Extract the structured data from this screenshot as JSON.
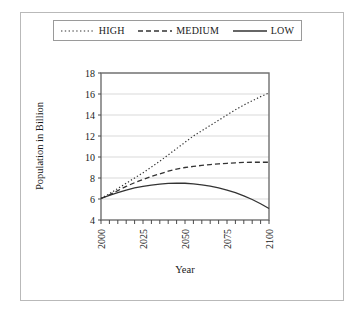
{
  "chart_data": {
    "type": "line",
    "title": "",
    "xlabel": "Year",
    "ylabel": "Population in Billion",
    "xlim": [
      2000,
      2100
    ],
    "ylim": [
      4,
      18
    ],
    "xticks": [
      2000,
      2025,
      2050,
      2075,
      2100
    ],
    "yticks": [
      4,
      6,
      8,
      10,
      12,
      14,
      16,
      18
    ],
    "grid": "horizontal",
    "legend_position": "top",
    "x": [
      2000,
      2005,
      2010,
      2015,
      2020,
      2025,
      2030,
      2035,
      2040,
      2045,
      2050,
      2055,
      2060,
      2065,
      2070,
      2075,
      2080,
      2085,
      2090,
      2095,
      2100
    ],
    "series": [
      {
        "name": "HIGH",
        "style": "dotted",
        "color": "#333333",
        "values": [
          6.05,
          6.5,
          7.0,
          7.5,
          8.0,
          8.5,
          9.05,
          9.6,
          10.2,
          10.8,
          11.4,
          12.0,
          12.5,
          13.0,
          13.5,
          14.0,
          14.5,
          14.95,
          15.35,
          15.75,
          16.1
        ]
      },
      {
        "name": "MEDIUM",
        "style": "dashed",
        "color": "#333333",
        "values": [
          6.05,
          6.4,
          6.8,
          7.2,
          7.55,
          7.85,
          8.15,
          8.4,
          8.65,
          8.85,
          9.0,
          9.1,
          9.2,
          9.28,
          9.35,
          9.4,
          9.45,
          9.48,
          9.5,
          9.5,
          9.5
        ]
      },
      {
        "name": "LOW",
        "style": "solid",
        "color": "#333333",
        "values": [
          6.05,
          6.35,
          6.6,
          6.85,
          7.05,
          7.2,
          7.32,
          7.42,
          7.48,
          7.5,
          7.5,
          7.44,
          7.35,
          7.22,
          7.05,
          6.85,
          6.6,
          6.3,
          5.95,
          5.55,
          5.1
        ]
      }
    ]
  },
  "legend": {
    "items": [
      {
        "label": "HIGH",
        "style": "dotted"
      },
      {
        "label": "MEDIUM",
        "style": "dashed"
      },
      {
        "label": "LOW",
        "style": "solid"
      }
    ]
  },
  "axes": {
    "x_title": "Year",
    "y_title": "Population in Billion",
    "x_tick_labels": [
      "2000",
      "2025",
      "2050",
      "2075",
      "2100"
    ],
    "y_tick_labels": [
      "4",
      "6",
      "8",
      "10",
      "12",
      "14",
      "16",
      "18"
    ]
  }
}
